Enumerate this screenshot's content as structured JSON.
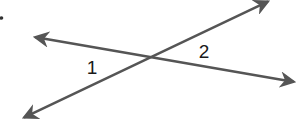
{
  "figure": {
    "type": "intersecting-lines",
    "width": 296,
    "height": 122,
    "stroke_color": "#555555",
    "stroke_width": 2.5,
    "bullet": {
      "x": 1.5,
      "y": 18,
      "r": 1.8
    },
    "lines": [
      {
        "name": "line-a",
        "description": "double-headed arrow from upper-left to lower-right",
        "start": {
          "x": 34,
          "y": 37
        },
        "end": {
          "x": 295,
          "y": 82
        }
      },
      {
        "name": "line-b",
        "description": "double-headed arrow from lower-left to upper-right",
        "start": {
          "x": 23,
          "y": 118
        },
        "end": {
          "x": 269,
          "y": 1
        }
      }
    ],
    "intersection": {
      "x": 150,
      "y": 57
    },
    "angles": [
      {
        "label": "1",
        "x": 92,
        "y": 74
      },
      {
        "label": "2",
        "x": 204,
        "y": 58
      }
    ]
  }
}
